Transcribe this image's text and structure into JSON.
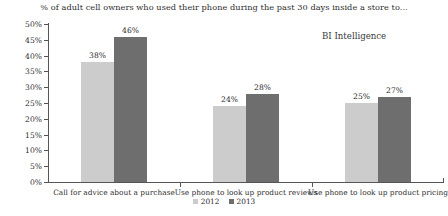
{
  "chart_data": {
    "type": "bar",
    "title": "% of adult cell owners who used their phone during the past 30 days inside a store to...",
    "xlabel": "",
    "ylabel": "",
    "ylim": [
      0,
      50
    ],
    "ytick_labels": [
      "50%",
      "45%",
      "40%",
      "35%",
      "30%",
      "25%",
      "20%",
      "15%",
      "10%",
      "5%",
      "0%"
    ],
    "ytick_values": [
      50,
      45,
      40,
      35,
      30,
      25,
      20,
      15,
      10,
      5,
      0
    ],
    "grid": false,
    "legend_position": "bottom-center",
    "categories": [
      "Call for advice about a purchase",
      "Use phone to look up product reviews",
      "Use phone to look up product pricing"
    ],
    "series": [
      {
        "name": "2012",
        "color": "#cccccc",
        "values": [
          38,
          24,
          25
        ],
        "labels": [
          "38%",
          "24%",
          "25%"
        ]
      },
      {
        "name": "2013",
        "color": "#6e6e6e",
        "values": [
          46,
          28,
          27
        ],
        "labels": [
          "46%",
          "28%",
          "27%"
        ]
      }
    ]
  },
  "branding": {
    "label": "BI Intelligence"
  },
  "legend": {
    "items": [
      {
        "label": "2012",
        "color": "#cccccc"
      },
      {
        "label": "2013",
        "color": "#6e6e6e"
      }
    ]
  }
}
